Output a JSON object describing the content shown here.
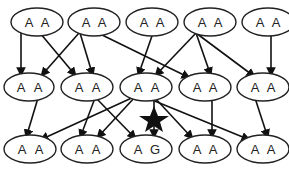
{
  "diagram": {
    "rows": [
      {
        "y": 22,
        "nodes": [
          {
            "id": "r1c1",
            "x": 37,
            "alleles": [
              "A",
              "A"
            ]
          },
          {
            "id": "r1c2",
            "x": 94,
            "alleles": [
              "A",
              "A"
            ]
          },
          {
            "id": "r1c3",
            "x": 152,
            "alleles": [
              "A",
              "A"
            ]
          },
          {
            "id": "r1c4",
            "x": 210,
            "alleles": [
              "A",
              "A"
            ]
          },
          {
            "id": "r1c5",
            "x": 268,
            "alleles": [
              "A",
              "A"
            ]
          }
        ]
      },
      {
        "y": 87,
        "nodes": [
          {
            "id": "r2c1",
            "x": 27,
            "alleles": [
              "A",
              "A"
            ]
          },
          {
            "id": "r2c2",
            "x": 85,
            "alleles": [
              "A",
              "A"
            ]
          },
          {
            "id": "r2c3",
            "x": 146,
            "alleles": [
              "A",
              "A"
            ]
          },
          {
            "id": "r2c4",
            "x": 205,
            "alleles": [
              "A",
              "A"
            ]
          },
          {
            "id": "r2c5",
            "x": 263,
            "alleles": [
              "A",
              "A"
            ]
          }
        ]
      },
      {
        "y": 149,
        "nodes": [
          {
            "id": "r3c1",
            "x": 30,
            "alleles": [
              "A",
              "A"
            ]
          },
          {
            "id": "r3c2",
            "x": 87,
            "alleles": [
              "A",
              "A"
            ]
          },
          {
            "id": "r3c3",
            "x": 146,
            "alleles": [
              "A",
              "G"
            ]
          },
          {
            "id": "r3c4",
            "x": 205,
            "alleles": [
              "A",
              "A"
            ]
          },
          {
            "id": "r3c5",
            "x": 263,
            "alleles": [
              "A",
              "A"
            ]
          }
        ]
      }
    ],
    "mutation_marker": {
      "symbol": "★",
      "x": 152,
      "y": 120,
      "label": "mutation"
    }
  }
}
